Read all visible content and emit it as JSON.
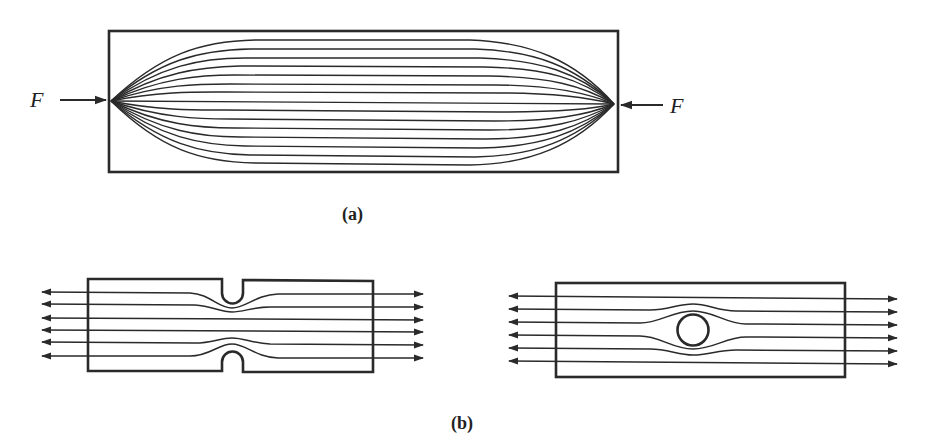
{
  "figure": {
    "panel_a": {
      "label": "(a)",
      "left_force_label": "F",
      "right_force_label": "F",
      "description": "Rectangular bar under compressive point loads F at both ends; stress flow lines fan out from the load points",
      "flow_line_count": 15
    },
    "panel_b": {
      "label": "(b)",
      "left_specimen": {
        "description": "Bar in tension with semicircular notches top and bottom; flow lines crowd around the notches",
        "flow_line_count": 6
      },
      "right_specimen": {
        "description": "Bar in tension with a central circular hole; flow lines crowd around the hole",
        "flow_line_count": 6
      }
    },
    "colors": {
      "ink": "#2a2a2a",
      "background": "#ffffff"
    }
  }
}
